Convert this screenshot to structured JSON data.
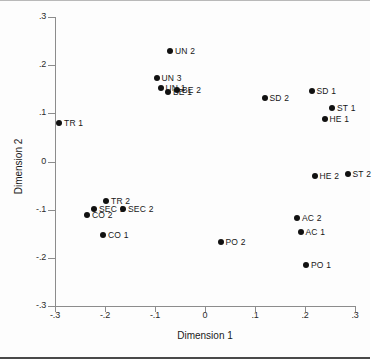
{
  "chart_data": {
    "type": "scatter",
    "title": "",
    "xlabel": "Dimension 1",
    "ylabel": "Dimension 2",
    "xlim": [
      -0.3,
      0.3
    ],
    "ylim": [
      -0.3,
      0.3
    ],
    "xticks": [
      "-.3",
      "-.2",
      "-.1",
      "0",
      ".1",
      ".2",
      ".3"
    ],
    "xtick_values": [
      -0.3,
      -0.2,
      -0.1,
      0,
      0.1,
      0.2,
      0.3
    ],
    "yticks": [
      ".3",
      ".2",
      ".1",
      "0",
      "-.1",
      "-.2",
      "-.3"
    ],
    "ytick_values": [
      0.3,
      0.2,
      0.1,
      0,
      -0.1,
      -0.2,
      -0.3
    ],
    "grid": false,
    "legend": false,
    "marker": "filled-circle",
    "marker_color": "#111111",
    "points": [
      {
        "label": "UN 2",
        "x": -0.07,
        "y": 0.229,
        "label_side": "right"
      },
      {
        "label": "UN 3",
        "x": -0.097,
        "y": 0.173,
        "label_side": "right"
      },
      {
        "label": "UN 1",
        "x": -0.089,
        "y": 0.152,
        "label_side": "right"
      },
      {
        "label": "BE 1",
        "x": -0.074,
        "y": 0.145,
        "label_side": "right"
      },
      {
        "label": "BE 2",
        "x": -0.056,
        "y": 0.148,
        "label_side": "right"
      },
      {
        "label": "SD 2",
        "x": 0.119,
        "y": 0.131,
        "label_side": "right"
      },
      {
        "label": "SD 1",
        "x": 0.213,
        "y": 0.147,
        "label_side": "right"
      },
      {
        "label": "ST 1",
        "x": 0.254,
        "y": 0.112,
        "label_side": "right"
      },
      {
        "label": "HE 1",
        "x": 0.239,
        "y": 0.089,
        "label_side": "right"
      },
      {
        "label": "TR 1",
        "x": -0.292,
        "y": 0.079,
        "label_side": "right"
      },
      {
        "label": "HE 2",
        "x": 0.219,
        "y": -0.031,
        "label_side": "right"
      },
      {
        "label": "ST 2",
        "x": 0.285,
        "y": -0.025,
        "label_side": "right"
      },
      {
        "label": "TR 2",
        "x": -0.198,
        "y": -0.081,
        "label_side": "right"
      },
      {
        "label": "SEC 1",
        "x": -0.222,
        "y": -0.098,
        "label_side": "right"
      },
      {
        "label": "SEC 2",
        "x": -0.164,
        "y": -0.098,
        "label_side": "right"
      },
      {
        "label": "CO 2",
        "x": -0.236,
        "y": -0.112,
        "label_side": "right"
      },
      {
        "label": "AC 2",
        "x": 0.184,
        "y": -0.118,
        "label_side": "right"
      },
      {
        "label": "AC 1",
        "x": 0.191,
        "y": -0.146,
        "label_side": "right"
      },
      {
        "label": "CO 1",
        "x": -0.204,
        "y": -0.152,
        "label_side": "right"
      },
      {
        "label": "PO 2",
        "x": 0.031,
        "y": -0.168,
        "label_side": "right"
      },
      {
        "label": "PO 1",
        "x": 0.202,
        "y": -0.215,
        "label_side": "right"
      }
    ]
  }
}
